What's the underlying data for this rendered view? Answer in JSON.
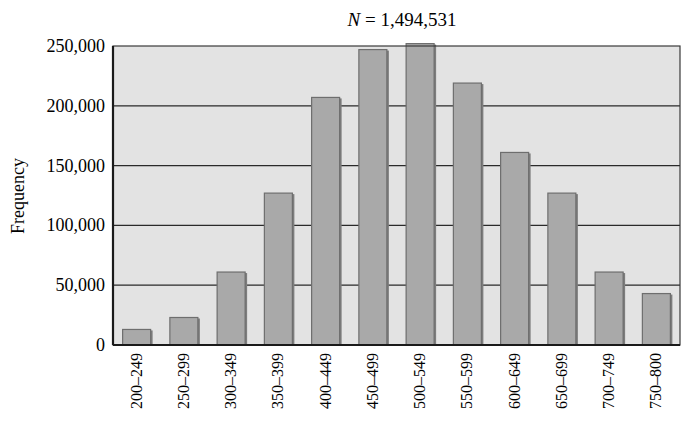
{
  "chart_data": {
    "type": "bar",
    "title": "N = 1,494,531",
    "title_parts": {
      "var": "N",
      "rest": " = 1,494,531"
    },
    "xlabel": "",
    "ylabel": "Frequency",
    "categories": [
      "200–249",
      "250–299",
      "300–349",
      "350–399",
      "400–449",
      "450–499",
      "500–549",
      "550–599",
      "600–649",
      "650–699",
      "700–749",
      "750–800"
    ],
    "values": [
      13000,
      23000,
      61000,
      127000,
      207000,
      247000,
      252000,
      219000,
      161000,
      127000,
      61000,
      43000
    ],
    "ylim": [
      0,
      250000
    ],
    "yticks": [
      0,
      50000,
      100000,
      150000,
      200000,
      250000
    ],
    "ytick_labels": [
      "0",
      "50,000",
      "100,000",
      "150,000",
      "200,000",
      "250,000"
    ],
    "grid": true,
    "legend": null,
    "colors": {
      "bar_fill": "#a9a9a9",
      "bar_edge": "#6e6e6e",
      "plot_bg": "#e3e3e3",
      "grid": "#2a2a2a",
      "axis": "#1a1a1a"
    }
  }
}
